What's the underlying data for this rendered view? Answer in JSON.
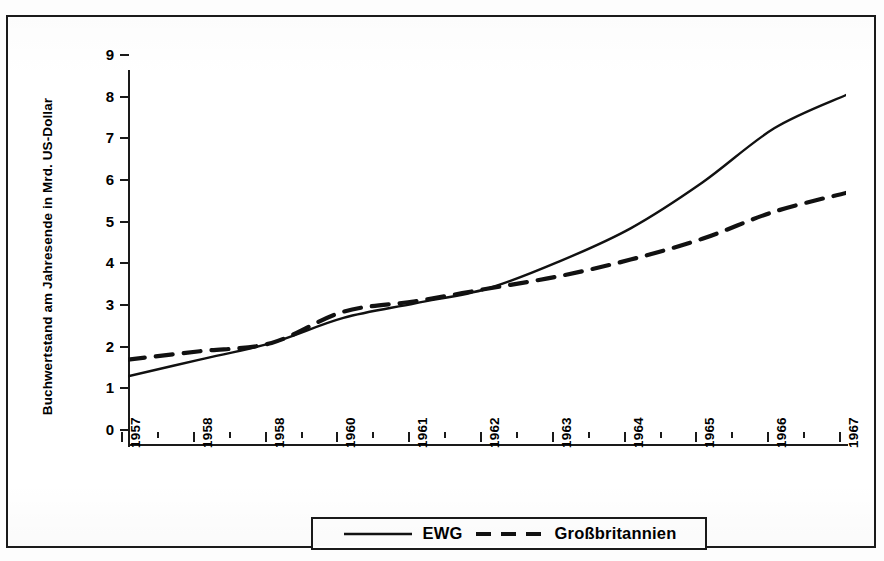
{
  "chart_data": {
    "type": "line",
    "title": "",
    "xlabel": "",
    "ylabel": "Buchwertstand am Jahresende in Mrd. US-Dollar",
    "x": [
      1957,
      1958,
      1958,
      1960,
      1961,
      1962,
      1963,
      1964,
      1965,
      1966,
      1967
    ],
    "xtick_labels": [
      "1957",
      "1958",
      "1958",
      "1960",
      "1961",
      "1962",
      "1963",
      "1964",
      "1965",
      "1966",
      "1967"
    ],
    "ytick_labels": [
      "0",
      "1",
      "2",
      "3",
      "4",
      "5",
      "6",
      "7",
      "8",
      "9"
    ],
    "ylim": [
      0,
      9
    ],
    "xlim": [
      1957,
      1967
    ],
    "grid": false,
    "legend_position": "bottom-center",
    "series": [
      {
        "name": "EWG",
        "style": "solid",
        "color": "#111111",
        "values": [
          1.65,
          2.05,
          2.45,
          3.05,
          3.4,
          3.75,
          4.4,
          5.2,
          6.3,
          7.6,
          8.4
        ]
      },
      {
        "name": "Großbritannien",
        "style": "dashed",
        "color": "#111111",
        "values": [
          2.05,
          2.25,
          2.45,
          3.2,
          3.45,
          3.75,
          4.05,
          4.45,
          4.95,
          5.6,
          6.05
        ]
      }
    ]
  },
  "ylabel": {
    "text": "Buchwertstand am Jahresende in Mrd. US-Dollar"
  },
  "legend": {
    "items": [
      {
        "label": "EWG",
        "style": "solid"
      },
      {
        "label": "Großbritannien",
        "style": "dashed"
      }
    ]
  }
}
